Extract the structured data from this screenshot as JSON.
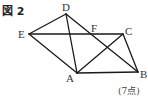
{
  "figure": {
    "label": "図 2",
    "score": "(7点)"
  },
  "points": {
    "A": {
      "label": "A",
      "x": 77,
      "y": 73
    },
    "B": {
      "label": "B",
      "x": 138,
      "y": 72
    },
    "C": {
      "label": "C",
      "x": 123,
      "y": 34
    },
    "D": {
      "label": "D",
      "x": 66,
      "y": 14
    },
    "E": {
      "label": "E",
      "x": 29,
      "y": 34
    },
    "F": {
      "label": "F",
      "x": 91,
      "y": 34
    }
  },
  "segments": [
    [
      "E",
      "D"
    ],
    [
      "D",
      "A"
    ],
    [
      "E",
      "A"
    ],
    [
      "E",
      "C"
    ],
    [
      "D",
      "B"
    ],
    [
      "A",
      "B"
    ],
    [
      "A",
      "C"
    ],
    [
      "C",
      "B"
    ]
  ],
  "stroke_color": "#1a1a1a"
}
